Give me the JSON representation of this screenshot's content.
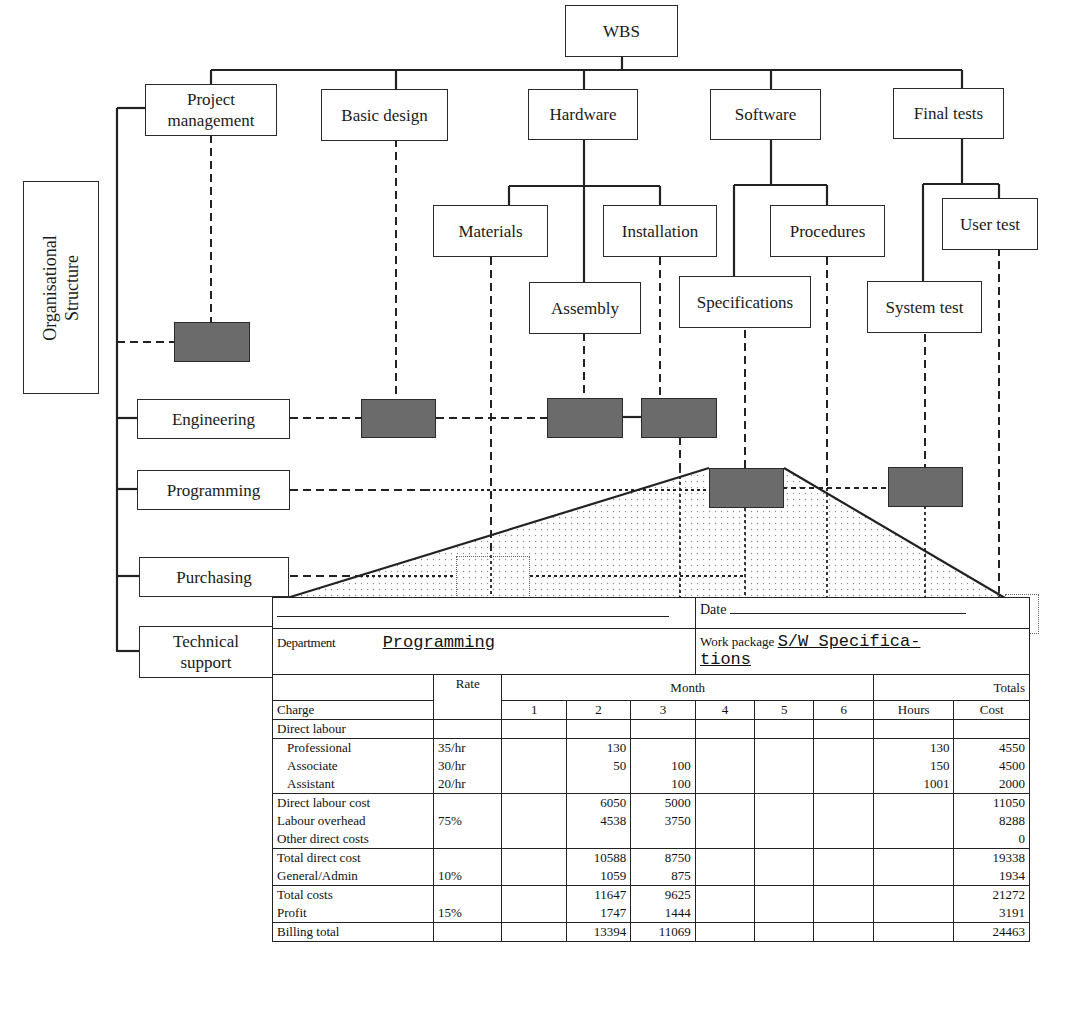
{
  "wbs": {
    "root": "WBS",
    "level1": [
      {
        "id": "pm",
        "label": "Project management"
      },
      {
        "id": "basic",
        "label": "Basic design"
      },
      {
        "id": "hw",
        "label": "Hardware"
      },
      {
        "id": "sw",
        "label": "Software"
      },
      {
        "id": "ft",
        "label": "Final tests"
      }
    ],
    "level2": {
      "materials": "Materials",
      "installation": "Installation",
      "assembly": "Assembly",
      "procedures": "Procedures",
      "specifications": "Specifications",
      "user_test": "User test",
      "system_test": "System test"
    }
  },
  "org": {
    "title": "Organisational\nStructure",
    "departments": {
      "engineering": "Engineering",
      "programming": "Programming",
      "purchasing": "Purchasing",
      "technical_support": "Technical support"
    }
  },
  "form": {
    "date_label": "Date",
    "department_label": "Department",
    "department_value": "Programming",
    "work_package_label": "Work package",
    "work_package_value_1": "S/W Specifica-",
    "work_package_value_2": "tions",
    "columns": {
      "rate": "Rate",
      "month": "Month",
      "totals": "Totals",
      "charge": "Charge",
      "months": [
        "1",
        "2",
        "3",
        "4",
        "5",
        "6"
      ],
      "hours": "Hours",
      "cost": "Cost"
    },
    "rows": [
      {
        "label": "Direct labour",
        "rate": "",
        "m": [
          "",
          "",
          "",
          "",
          "",
          ""
        ],
        "hours": "",
        "cost": "",
        "group": "a"
      },
      {
        "label": "Professional",
        "rate": "35/hr",
        "m": [
          "",
          "130",
          "",
          "",
          "",
          ""
        ],
        "hours": "130",
        "cost": "4550",
        "group": "b",
        "indent": true
      },
      {
        "label": "Associate",
        "rate": "30/hr",
        "m": [
          "",
          "50",
          "100",
          "",
          "",
          ""
        ],
        "hours": "150",
        "cost": "4500",
        "group": "b",
        "indent": true
      },
      {
        "label": "Assistant",
        "rate": "20/hr",
        "m": [
          "",
          "",
          "100",
          "",
          "",
          ""
        ],
        "hours": "1001",
        "cost": "2000",
        "group": "b",
        "indent": true
      },
      {
        "label": "Direct labour cost",
        "rate": "",
        "m": [
          "",
          "6050",
          "5000",
          "",
          "",
          ""
        ],
        "hours": "",
        "cost": "11050",
        "group": "c"
      },
      {
        "label": "Labour overhead",
        "rate": "75%",
        "m": [
          "",
          "4538",
          "3750",
          "",
          "",
          ""
        ],
        "hours": "",
        "cost": "8288",
        "group": "c"
      },
      {
        "label": "Other direct costs",
        "rate": "",
        "m": [
          "",
          "",
          "",
          "",
          "",
          ""
        ],
        "hours": "",
        "cost": "0",
        "group": "c"
      },
      {
        "label": "Total direct cost",
        "rate": "",
        "m": [
          "",
          "10588",
          "8750",
          "",
          "",
          ""
        ],
        "hours": "",
        "cost": "19338",
        "group": "d"
      },
      {
        "label": "General/Admin",
        "rate": "10%",
        "m": [
          "",
          "1059",
          "875",
          "",
          "",
          ""
        ],
        "hours": "",
        "cost": "1934",
        "group": "d"
      },
      {
        "label": "Total costs",
        "rate": "",
        "m": [
          "",
          "11647",
          "9625",
          "",
          "",
          ""
        ],
        "hours": "",
        "cost": "21272",
        "group": "e"
      },
      {
        "label": "Profit",
        "rate": "15%",
        "m": [
          "",
          "1747",
          "1444",
          "",
          "",
          ""
        ],
        "hours": "",
        "cost": "3191",
        "group": "e"
      },
      {
        "label": "Billing total",
        "rate": "",
        "m": [
          "",
          "13394",
          "11069",
          "",
          "",
          ""
        ],
        "hours": "",
        "cost": "24463",
        "group": "f"
      }
    ]
  },
  "colors": {
    "line": "#2a2a2a",
    "work_package_fill": "#6b6b6b",
    "stipple": "#9a9a9a"
  }
}
